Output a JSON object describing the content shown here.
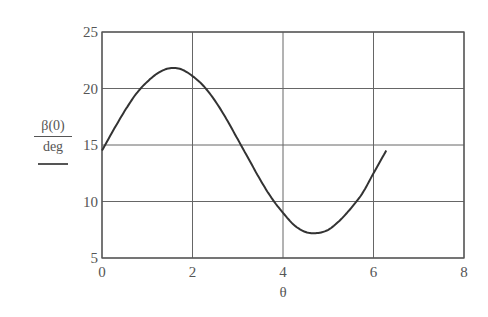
{
  "chart_data": {
    "type": "line",
    "title": "",
    "xlabel": "θ",
    "ylabel": "β(0) / deg",
    "ylabel_numerator": "β(0)",
    "ylabel_denominator": "deg",
    "xlim": [
      0,
      8
    ],
    "ylim": [
      5,
      25
    ],
    "xticks": [
      0,
      2,
      4,
      6,
      8
    ],
    "yticks": [
      5,
      10,
      15,
      20,
      25
    ],
    "xtick_labels": [
      "0",
      "2",
      "4",
      "6",
      "8"
    ],
    "ytick_labels": [
      "5",
      "10",
      "15",
      "20",
      "25"
    ],
    "grid": true,
    "legend": null,
    "series": [
      {
        "name": "β(0)",
        "color": "#333333",
        "x": [
          0,
          0.25,
          0.5,
          0.75,
          1.0,
          1.25,
          1.5,
          1.75,
          2.0,
          2.25,
          2.5,
          2.75,
          3.0,
          3.25,
          3.5,
          3.75,
          4.0,
          4.25,
          4.5,
          4.75,
          5.0,
          5.25,
          5.5,
          5.75,
          6.0,
          6.28
        ],
        "values": [
          14.5,
          16.3,
          18.0,
          19.5,
          20.6,
          21.4,
          21.8,
          21.7,
          21.1,
          20.2,
          18.9,
          17.3,
          15.5,
          13.7,
          11.9,
          10.3,
          9.0,
          7.9,
          7.3,
          7.2,
          7.5,
          8.3,
          9.4,
          10.7,
          12.5,
          14.5
        ]
      }
    ]
  },
  "plot": {
    "x0_px": 102,
    "x_px_per_unit": 45.25,
    "y0_px": 258,
    "y_px_per_unit": 11.3,
    "frame_color": "#555555",
    "grid_color": "#666666"
  }
}
